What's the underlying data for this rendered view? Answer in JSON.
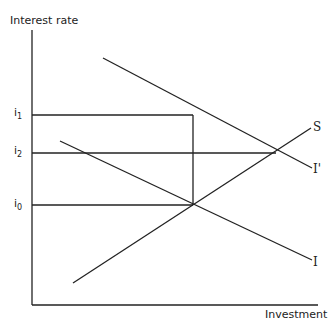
{
  "diagram": {
    "y_axis_label": "Interest rate",
    "x_axis_label": "Investment",
    "rate_levels": [
      {
        "id": "i1",
        "base": "i",
        "sub": "1"
      },
      {
        "id": "i2",
        "base": "i",
        "sub": "2"
      },
      {
        "id": "i0",
        "base": "i",
        "sub": "0"
      }
    ],
    "curves": [
      {
        "id": "S",
        "label": "S",
        "description": "upward sloping savings curve"
      },
      {
        "id": "I_prime",
        "label": "I'",
        "description": "shifted investment demand curve"
      },
      {
        "id": "I",
        "label": "I",
        "description": "original investment demand curve"
      }
    ],
    "line_color": "#222222"
  }
}
